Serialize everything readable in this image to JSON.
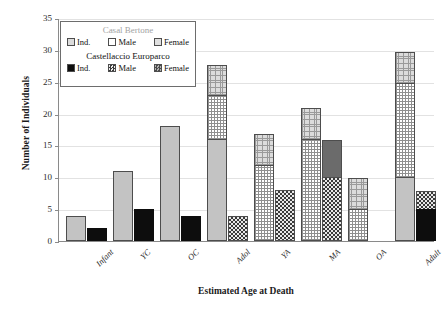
{
  "chart_data": {
    "type": "bar",
    "title": "",
    "xlabel": "Estimated Age at Death",
    "ylabel": "Number of Individuals",
    "categories": [
      "Infant",
      "YC",
      "OC",
      "Adol",
      "YA",
      "MA",
      "OA",
      "Adult"
    ],
    "ylim": [
      0,
      35
    ],
    "yticks": [
      0,
      5,
      10,
      15,
      20,
      25,
      30,
      35
    ],
    "grid": true,
    "legend_position": "top-left",
    "stacked": true,
    "grouped": true,
    "groups": [
      {
        "name": "Casal Bertone",
        "color": "#a3a3a3",
        "series": [
          {
            "name": "Ind.",
            "values": [
              4,
              11,
              18,
              16,
              0,
              0,
              0,
              10
            ]
          },
          {
            "name": "Male",
            "values": [
              0,
              0,
              0,
              7,
              12,
              16,
              5,
              15
            ]
          },
          {
            "name": "Female",
            "values": [
              0,
              0,
              0,
              5,
              5,
              5,
              5,
              5
            ]
          }
        ],
        "totals": [
          4,
          11,
          18,
          28,
          17,
          21,
          10,
          30
        ]
      },
      {
        "name": "Castellaccio Europarco",
        "color": "#111111",
        "series": [
          {
            "name": "Ind.",
            "values": [
              2,
              5,
              4,
              0,
              0,
              0,
              0,
              5
            ]
          },
          {
            "name": "Male",
            "values": [
              0,
              0,
              0,
              4,
              8,
              10,
              0,
              3
            ]
          },
          {
            "name": "Female",
            "values": [
              0,
              0,
              0,
              0,
              0,
              6,
              0,
              0
            ]
          }
        ],
        "totals": [
          2,
          5,
          4,
          4,
          8,
          16,
          0,
          8
        ]
      }
    ]
  },
  "axes": {
    "y_title": "Number of Individuals",
    "x_title": "Estimated Age at Death",
    "y_ticks": [
      "0",
      "5",
      "10",
      "15",
      "20",
      "25",
      "30",
      "35"
    ],
    "x_ticks": [
      "Infant",
      "YC",
      "OC",
      "Adol",
      "YA",
      "MA",
      "OA",
      "Adult"
    ]
  },
  "legend": {
    "casal_bertone": {
      "title": "Casal Bertone",
      "items": [
        {
          "label": "Ind.",
          "swatch": "cb-ind-swatch"
        },
        {
          "label": "Male",
          "swatch": "cb-male-swatch"
        },
        {
          "label": "Female",
          "swatch": "cb-female-swatch"
        }
      ]
    },
    "castellaccio_europarco": {
      "title": "Castellaccio Europarco",
      "items": [
        {
          "label": "Ind.",
          "swatch": "ce-ind-swatch"
        },
        {
          "label": "Male",
          "swatch": "ce-male-swatch"
        },
        {
          "label": "Female",
          "swatch": "ce-female-swatch"
        }
      ]
    }
  }
}
